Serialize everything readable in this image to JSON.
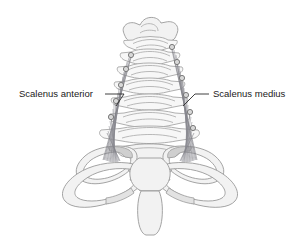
{
  "figure": {
    "background_color": "#ffffff",
    "width": 308,
    "height": 246
  },
  "labels": {
    "left": {
      "text": "Scalenus anterior",
      "x": 19,
      "y": 97,
      "icon": "text-label"
    },
    "right": {
      "text": "Scalenus medius",
      "x": 213,
      "y": 97,
      "icon": "text-label"
    }
  },
  "colors": {
    "bone": "#f2f2f2",
    "bone_outline": "#9a9a9a",
    "shading": "#e2e2e2",
    "shading_dark": "#cfcfcf",
    "muscle": "#8e8e94",
    "attachment": "#d8d8d8",
    "leader": "#2b2b2b",
    "text": "#1a1a1a"
  },
  "anatomy": {
    "structures": [
      "atlas",
      "cervical-vertebrae",
      "transverse-processes",
      "first-rib-left",
      "first-rib-right",
      "clavicle-left",
      "clavicle-right",
      "manubrium",
      "sternum-body",
      "scalenus-anterior-muscle",
      "scalenus-medius-muscle"
    ],
    "attachment_counts": {
      "scalenus_anterior": 5,
      "scalenus_medius": 6
    }
  }
}
